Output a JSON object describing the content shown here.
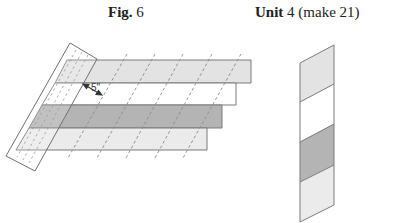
{
  "figure": {
    "title_bold": "Fig.",
    "title_num": "6",
    "measurement_label": "5\"",
    "strips": [
      {
        "color": "#e3e3e3",
        "x_left_top": 67,
        "x_right": 251,
        "y_top": 60,
        "y_bottom": 83
      },
      {
        "color": "#ffffff",
        "x_left_top": 55,
        "x_right": 236,
        "y_top": 83,
        "y_bottom": 105
      },
      {
        "color": "#b4b4b4",
        "x_left_top": 42,
        "x_right": 222,
        "y_top": 105,
        "y_bottom": 128
      },
      {
        "color": "#ebebeb",
        "x_left_top": 29,
        "x_right": 207,
        "y_top": 128,
        "y_bottom": 150
      }
    ],
    "cut_lines_count": 5
  },
  "unit": {
    "title_bold": "Unit",
    "title_rest": "4 (make 21)",
    "segments": [
      {
        "color": "#e3e3e3"
      },
      {
        "color": "#ffffff"
      },
      {
        "color": "#b4b4b4"
      },
      {
        "color": "#ebebeb"
      }
    ]
  },
  "colors": {
    "outline": "#7a7a7a",
    "dash": "#8a8a8a"
  }
}
